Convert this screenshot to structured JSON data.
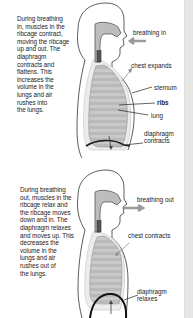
{
  "panels": [
    {
      "id": "inhale",
      "description": [
        "During breathing",
        "in, muscles in the",
        "ribcage contract,",
        "moving the ribcage",
        "up and out. The",
        "diaphragm",
        "contracts and",
        "flattens. This",
        "increases the",
        "volume in the",
        "lungs and air",
        "rushes into",
        "the lungs."
      ],
      "labels": {
        "breathing": "breathing in",
        "chest": "chest expands",
        "sternum": "sternum",
        "ribs": "ribs",
        "lung": "lung",
        "diaphragm_1": "diaphragm",
        "diaphragm_2": "contracts"
      }
    },
    {
      "id": "exhale",
      "description": [
        "During breathing",
        "out, muscles in the",
        "ribcage relax and",
        "the ribcage moves",
        "down and in. The",
        "diaphragm relaxes",
        "and moves up. This",
        "decreases the",
        "volume in the",
        "lungs and air",
        "rushes out of",
        "the lungs."
      ],
      "labels": {
        "breathing": "breathing out",
        "chest": "chest contracts",
        "diaphragm_1": "diaphragm",
        "diaphragm_2": "relaxes"
      }
    }
  ],
  "colors": {
    "outline": "#333333",
    "lung_fill": "#c8c8c8",
    "airway_fill": "#bdbdbd",
    "arrow": "#9a9a9a",
    "side_strip": "#e6e6e6"
  }
}
